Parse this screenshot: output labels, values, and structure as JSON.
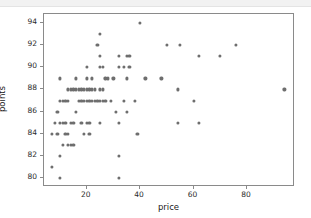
{
  "chart_data": {
    "type": "scatter",
    "title": "",
    "xlabel": "price",
    "ylabel": "points",
    "xlim": [
      4,
      98
    ],
    "ylim": [
      79.2,
      94.8
    ],
    "xticks": [
      20,
      40,
      60,
      80
    ],
    "yticks": [
      80,
      82,
      84,
      86,
      88,
      90,
      92,
      94
    ],
    "grid": false,
    "legend": false,
    "marker": {
      "shape": "circle",
      "color": "#6e6e6e",
      "size_px": 3.2
    },
    "axes": {
      "frame_color": "#8a8a8a",
      "background": "#ffffff"
    },
    "points": [
      {
        "x": 7,
        "y": 81
      },
      {
        "x": 7,
        "y": 84
      },
      {
        "x": 8,
        "y": 85
      },
      {
        "x": 9,
        "y": 86
      },
      {
        "x": 9,
        "y": 84
      },
      {
        "x": 10,
        "y": 89
      },
      {
        "x": 10,
        "y": 87
      },
      {
        "x": 10,
        "y": 85
      },
      {
        "x": 10,
        "y": 82
      },
      {
        "x": 10,
        "y": 80
      },
      {
        "x": 11,
        "y": 87
      },
      {
        "x": 11,
        "y": 85
      },
      {
        "x": 11,
        "y": 83
      },
      {
        "x": 12,
        "y": 87
      },
      {
        "x": 12,
        "y": 85
      },
      {
        "x": 12,
        "y": 84
      },
      {
        "x": 13,
        "y": 88
      },
      {
        "x": 13,
        "y": 87
      },
      {
        "x": 13,
        "y": 83
      },
      {
        "x": 13,
        "y": 84
      },
      {
        "x": 14,
        "y": 88
      },
      {
        "x": 14,
        "y": 85
      },
      {
        "x": 14,
        "y": 83
      },
      {
        "x": 15,
        "y": 88
      },
      {
        "x": 15,
        "y": 85
      },
      {
        "x": 15,
        "y": 83
      },
      {
        "x": 16,
        "y": 89
      },
      {
        "x": 16,
        "y": 88
      },
      {
        "x": 16,
        "y": 86
      },
      {
        "x": 17,
        "y": 88
      },
      {
        "x": 17,
        "y": 87
      },
      {
        "x": 18,
        "y": 88
      },
      {
        "x": 18,
        "y": 87
      },
      {
        "x": 18,
        "y": 85
      },
      {
        "x": 19,
        "y": 88
      },
      {
        "x": 19,
        "y": 87
      },
      {
        "x": 19,
        "y": 84
      },
      {
        "x": 20,
        "y": 90
      },
      {
        "x": 20,
        "y": 89
      },
      {
        "x": 20,
        "y": 88
      },
      {
        "x": 20,
        "y": 87
      },
      {
        "x": 20,
        "y": 85
      },
      {
        "x": 21,
        "y": 88
      },
      {
        "x": 21,
        "y": 87
      },
      {
        "x": 21,
        "y": 85
      },
      {
        "x": 21,
        "y": 84
      },
      {
        "x": 22,
        "y": 89
      },
      {
        "x": 22,
        "y": 88
      },
      {
        "x": 22,
        "y": 87
      },
      {
        "x": 23,
        "y": 88
      },
      {
        "x": 23,
        "y": 87
      },
      {
        "x": 24,
        "y": 92
      },
      {
        "x": 24,
        "y": 87
      },
      {
        "x": 25,
        "y": 93
      },
      {
        "x": 25,
        "y": 91
      },
      {
        "x": 25,
        "y": 90
      },
      {
        "x": 25,
        "y": 88
      },
      {
        "x": 25,
        "y": 87
      },
      {
        "x": 25,
        "y": 85
      },
      {
        "x": 26,
        "y": 90
      },
      {
        "x": 26,
        "y": 88
      },
      {
        "x": 26,
        "y": 87
      },
      {
        "x": 27,
        "y": 89
      },
      {
        "x": 27,
        "y": 87
      },
      {
        "x": 28,
        "y": 89
      },
      {
        "x": 29,
        "y": 87
      },
      {
        "x": 30,
        "y": 89
      },
      {
        "x": 31,
        "y": 86
      },
      {
        "x": 32,
        "y": 91
      },
      {
        "x": 32,
        "y": 90
      },
      {
        "x": 32,
        "y": 85
      },
      {
        "x": 32,
        "y": 82
      },
      {
        "x": 32,
        "y": 80
      },
      {
        "x": 34,
        "y": 90
      },
      {
        "x": 34,
        "y": 87
      },
      {
        "x": 35,
        "y": 91
      },
      {
        "x": 35,
        "y": 89
      },
      {
        "x": 35,
        "y": 86
      },
      {
        "x": 36,
        "y": 91
      },
      {
        "x": 36,
        "y": 90
      },
      {
        "x": 38,
        "y": 87
      },
      {
        "x": 39,
        "y": 84
      },
      {
        "x": 40,
        "y": 94
      },
      {
        "x": 42,
        "y": 89
      },
      {
        "x": 48,
        "y": 89
      },
      {
        "x": 50,
        "y": 92
      },
      {
        "x": 54,
        "y": 88
      },
      {
        "x": 54,
        "y": 85
      },
      {
        "x": 55,
        "y": 92
      },
      {
        "x": 60,
        "y": 87
      },
      {
        "x": 62,
        "y": 91
      },
      {
        "x": 62,
        "y": 85
      },
      {
        "x": 70,
        "y": 91
      },
      {
        "x": 76,
        "y": 92
      },
      {
        "x": 94,
        "y": 88
      }
    ]
  }
}
